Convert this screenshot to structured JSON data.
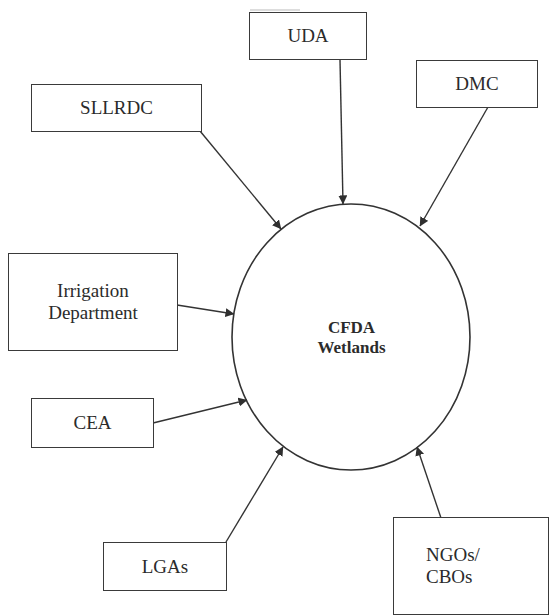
{
  "diagram": {
    "type": "hub-and-spoke",
    "hub": {
      "id": "cfda",
      "line1": "CFDA",
      "line2": "Wetlands"
    },
    "nodes": [
      {
        "id": "uda",
        "line1": "UDA",
        "line2": ""
      },
      {
        "id": "dmc",
        "line1": "DMC",
        "line2": ""
      },
      {
        "id": "sllrdc",
        "line1": "SLLRDC",
        "line2": ""
      },
      {
        "id": "irrigation",
        "line1": "Irrigation",
        "line2": "Department"
      },
      {
        "id": "cea",
        "line1": "CEA",
        "line2": ""
      },
      {
        "id": "lgas",
        "line1": "LGAs",
        "line2": ""
      },
      {
        "id": "ngos",
        "line1": "NGOs/",
        "line2": "CBOs"
      }
    ],
    "edges": [
      {
        "from": "uda",
        "to": "cfda"
      },
      {
        "from": "dmc",
        "to": "cfda"
      },
      {
        "from": "sllrdc",
        "to": "cfda"
      },
      {
        "from": "irrigation",
        "to": "cfda"
      },
      {
        "from": "cea",
        "to": "cfda"
      },
      {
        "from": "lgas",
        "to": "cfda"
      },
      {
        "from": "ngos",
        "to": "cfda"
      }
    ],
    "colors": {
      "stroke": "#333333",
      "background": "#ffffff",
      "text": "#2b2b2b"
    }
  }
}
